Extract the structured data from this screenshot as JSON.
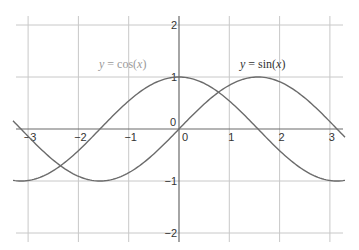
{
  "chart_data": {
    "type": "line",
    "title": "",
    "xlabel": "",
    "ylabel": "",
    "xlim": [
      -3.3,
      3.3
    ],
    "ylim": [
      -2.1,
      2.1
    ],
    "grid": true,
    "x_ticks": [
      -3,
      -2,
      -1,
      0,
      1,
      2,
      3
    ],
    "x_tick_labels": [
      "-3",
      "-2",
      "-1",
      "0",
      "1",
      "2",
      "3"
    ],
    "y_ticks": [
      -2,
      -1,
      0,
      1,
      2
    ],
    "y_tick_labels": [
      "-2",
      "-1",
      "0",
      "1",
      "2"
    ],
    "series": [
      {
        "name": "y = cos(x)",
        "function": "cos",
        "x": [
          -3.3,
          -3,
          -2.5,
          -2,
          -1.5,
          -1,
          -0.5,
          0,
          0.5,
          1,
          1.5,
          2,
          2.5,
          3,
          3.3
        ],
        "values": [
          -0.99,
          -0.99,
          -0.8,
          -0.42,
          0.07,
          0.54,
          0.88,
          1.0,
          0.88,
          0.54,
          0.07,
          -0.42,
          -0.8,
          -0.99,
          -0.99
        ],
        "label": {
          "prefix": "y",
          "eq": " = cos(",
          "var": "x",
          "suffix": ")",
          "color": "#9a9a9a"
        }
      },
      {
        "name": "y = sin(x)",
        "function": "sin",
        "x": [
          -3.3,
          -3,
          -2.5,
          -2,
          -1.5,
          -1,
          -0.5,
          0,
          0.5,
          1,
          1.5,
          2,
          2.5,
          3,
          3.3
        ],
        "values": [
          0.16,
          -0.14,
          -0.6,
          -0.91,
          -1.0,
          -0.84,
          -0.48,
          0.0,
          0.48,
          0.84,
          1.0,
          0.91,
          0.6,
          0.14,
          -0.16
        ],
        "label": {
          "prefix": "y",
          "eq": " = sin(",
          "var": "x",
          "suffix": ")",
          "color": "#333333"
        }
      }
    ]
  },
  "colors": {
    "grid": "#c8c8c8",
    "axis": "#6a6a6a",
    "curve": "#6b6b6b",
    "tick_text": "#333333"
  }
}
